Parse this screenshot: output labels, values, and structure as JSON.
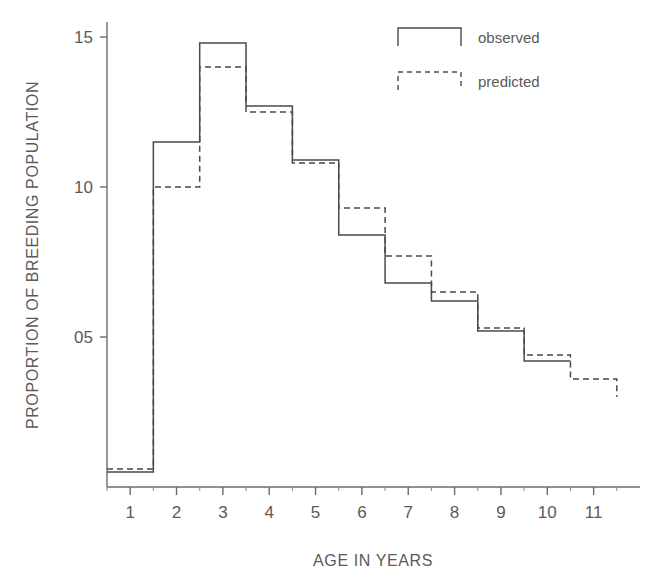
{
  "chart_data": {
    "type": "line",
    "subtype": "step",
    "title": "",
    "xlabel": "AGE IN YEARS",
    "ylabel": "PROPORTION OF BREEDING POPULATION",
    "xlim": [
      0.5,
      12.0
    ],
    "ylim": [
      0.0,
      0.155
    ],
    "grid": false,
    "legend_position": "top-right",
    "xticks": [
      1,
      2,
      3,
      4,
      5,
      6,
      7,
      8,
      9,
      10,
      11
    ],
    "xtick_labels": [
      "1",
      "2",
      "3",
      "4",
      "5",
      "6",
      "7",
      "8",
      "9",
      "10",
      "11"
    ],
    "yticks": [
      0.05,
      0.1,
      0.15
    ],
    "ytick_labels": [
      "05",
      "10",
      "15"
    ],
    "step_edges": [
      0.5,
      1.5,
      2.5,
      3.5,
      4.5,
      5.5,
      6.5,
      7.5,
      8.5,
      9.5,
      10.5,
      11.5
    ],
    "series": [
      {
        "name": "observed",
        "style": "solid",
        "values": [
          0.005,
          0.115,
          0.148,
          0.127,
          0.109,
          0.084,
          0.068,
          0.062,
          0.052,
          0.042
        ]
      },
      {
        "name": "predicted",
        "style": "dashed",
        "values": [
          0.006,
          0.1,
          0.14,
          0.125,
          0.108,
          0.093,
          0.077,
          0.065,
          0.053,
          0.044,
          0.036,
          0.03
        ]
      }
    ]
  },
  "legend": {
    "items": [
      {
        "label": "observed",
        "style": "solid"
      },
      {
        "label": "predicted",
        "style": "dashed"
      }
    ]
  },
  "axes": {
    "x_title": "AGE IN YEARS",
    "y_title": "PROPORTION OF BREEDING POPULATION"
  }
}
